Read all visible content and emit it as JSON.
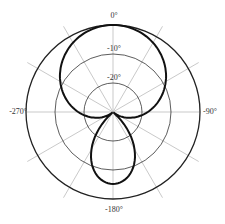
{
  "chart_data": {
    "type": "polar-line",
    "title": "",
    "angle_labels": [
      "0°",
      "-90°",
      "-180°",
      "-270°"
    ],
    "radial_labels": [
      "-10°",
      "-20°"
    ],
    "radial_label_rings_px": {
      "outer_0": 87,
      "-10": 58,
      "-20": 29,
      "center": 0
    },
    "angular_grid_step_deg": 30,
    "radial_scale_assumption": "linear, 0 dB at outer ring, -30 dB at center (inferred, not read from image)",
    "series": [
      {
        "name": "pattern",
        "angle_deg": [
          0,
          30,
          60,
          90,
          120,
          150,
          180,
          210,
          240,
          270,
          300,
          330
        ],
        "radius_px": [
          87,
          84,
          73,
          50,
          0,
          52,
          72,
          52,
          0,
          50,
          73,
          84
        ],
        "radius_fraction": [
          1.0,
          0.966,
          0.839,
          0.575,
          0.0,
          0.598,
          0.828,
          0.598,
          0.0,
          0.575,
          0.839,
          0.966
        ],
        "level_db_assumed": [
          0,
          -1.0,
          -4.8,
          -12.8,
          null,
          -12.1,
          -5.2,
          -12.1,
          null,
          -12.8,
          -4.8,
          -1.0
        ]
      }
    ],
    "colors": {
      "curve": "#111111",
      "ring": "#333333",
      "spoke": "#bbbbbb"
    }
  },
  "labels": {
    "top": "0°",
    "right": "-90°",
    "bottom": "-180°",
    "left": "-270°",
    "ring1": "-10°",
    "ring2": "-20°"
  }
}
